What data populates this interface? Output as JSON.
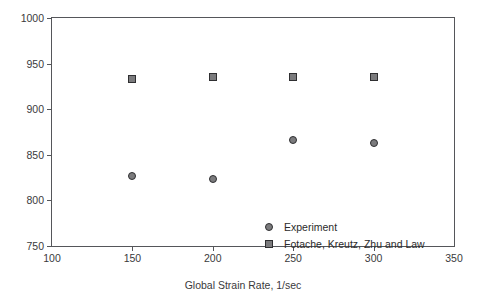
{
  "chart_data": {
    "type": "scatter",
    "title": "",
    "xlabel": "Global Strain Rate, 1/sec",
    "ylabel": "Ignition Temperature, K",
    "xlim": [
      100,
      350
    ],
    "ylim": [
      750,
      1000
    ],
    "xticks": [
      100,
      150,
      200,
      250,
      300,
      350
    ],
    "yticks": [
      750,
      800,
      850,
      900,
      950,
      1000
    ],
    "xtick_labels": [
      "100",
      "150",
      "200",
      "250",
      "300",
      "350"
    ],
    "ytick_labels": [
      "750",
      "800",
      "850",
      "900",
      "950",
      "1000"
    ],
    "grid": false,
    "legend_position": "bottom-right",
    "series": [
      {
        "name": "Experiment",
        "marker": "circle",
        "fill": "#7b7b7d",
        "edge": "#2f2f31",
        "x": [
          150,
          200,
          250,
          300
        ],
        "y": [
          827,
          824,
          866,
          863
        ]
      },
      {
        "name": "Fotache, Kreutz, Zhu and Law",
        "marker": "square",
        "fill": "#7b7b7d",
        "edge": "#2f2f31",
        "x": [
          150,
          200,
          250,
          300
        ],
        "y": [
          933,
          935,
          935,
          935
        ]
      }
    ]
  },
  "legend": {
    "entries": [
      {
        "label": "Experiment",
        "marker": "circle"
      },
      {
        "label": "Fotache, Kreutz, Zhu and Law",
        "marker": "square"
      }
    ]
  }
}
